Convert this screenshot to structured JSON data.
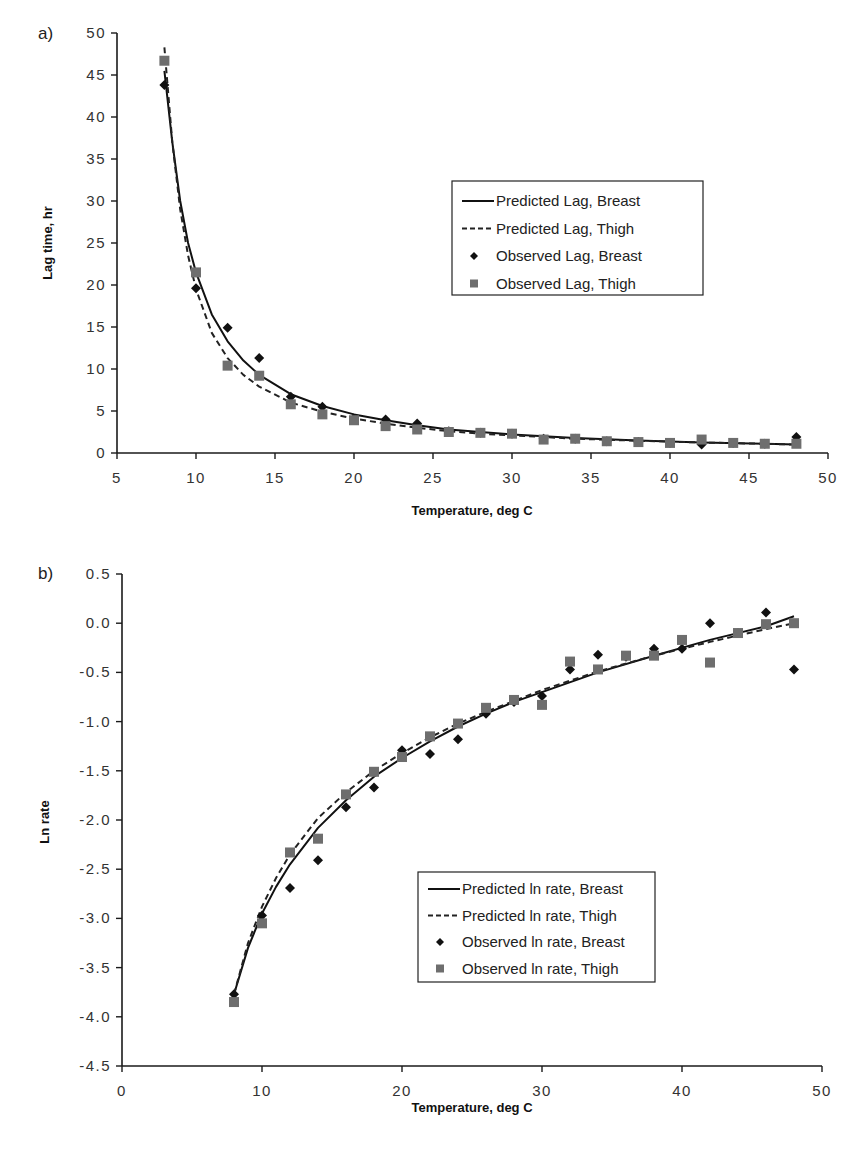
{
  "chart_data": [
    {
      "panel_label": "a)",
      "type": "scatter",
      "title": "",
      "xlabel": "Temperature, deg C",
      "ylabel": "Lag time, hr",
      "xlim": [
        5,
        50
      ],
      "ylim": [
        0,
        50
      ],
      "xticks": [
        5,
        10,
        15,
        20,
        25,
        30,
        35,
        40,
        45,
        50
      ],
      "yticks": [
        0,
        5,
        10,
        15,
        20,
        25,
        30,
        35,
        40,
        45,
        50
      ],
      "ytick_labels": [
        "0",
        "5",
        "10",
        "15",
        "20",
        "25",
        "30",
        "35",
        "40",
        "45",
        "50"
      ],
      "grid": false,
      "legend_position": "upper right (inside)",
      "series": [
        {
          "name": "Predicted Lag, Breast",
          "kind": "line",
          "style": "solid",
          "x": [
            8,
            8.5,
            9,
            9.5,
            10,
            11,
            12,
            13,
            14,
            16,
            18,
            20,
            22,
            24,
            26,
            28,
            30,
            34,
            38,
            42,
            46,
            48
          ],
          "y": [
            45.5,
            37,
            30,
            25,
            21.5,
            16.5,
            13.3,
            11.0,
            9.3,
            7.0,
            5.6,
            4.6,
            3.9,
            3.3,
            2.8,
            2.5,
            2.2,
            1.8,
            1.5,
            1.25,
            1.1,
            1.0
          ]
        },
        {
          "name": "Predicted Lag, Thigh",
          "kind": "line",
          "style": "dashed",
          "x": [
            8,
            8.5,
            9,
            9.5,
            10,
            11,
            12,
            13,
            14,
            16,
            18,
            20,
            22,
            24,
            26,
            28,
            30,
            34,
            38,
            42,
            46,
            48
          ],
          "y": [
            48.3,
            37,
            29,
            23.5,
            19.5,
            14.3,
            11.3,
            9.3,
            7.9,
            6.0,
            4.9,
            4.1,
            3.5,
            3.0,
            2.6,
            2.3,
            2.1,
            1.7,
            1.45,
            1.25,
            1.1,
            1.0
          ]
        },
        {
          "name": "Observed Lag, Breast",
          "kind": "marker",
          "marker": "diamond",
          "x": [
            8,
            10,
            12,
            14,
            16,
            18,
            20,
            22,
            24,
            26,
            28,
            30,
            32,
            34,
            36,
            38,
            40,
            42,
            44,
            46,
            48
          ],
          "y": [
            43.8,
            19.6,
            14.9,
            11.3,
            6.7,
            5.5,
            4.1,
            4.0,
            3.5,
            2.6,
            2.4,
            2.3,
            1.7,
            1.7,
            1.4,
            1.3,
            1.2,
            1.0,
            1.2,
            1.1,
            1.9
          ]
        },
        {
          "name": "Observed Lag, Thigh",
          "kind": "marker",
          "marker": "square",
          "x": [
            8,
            10,
            12,
            14,
            16,
            18,
            20,
            22,
            24,
            26,
            28,
            30,
            32,
            34,
            36,
            38,
            40,
            42,
            44,
            46,
            48
          ],
          "y": [
            46.7,
            21.5,
            10.4,
            9.2,
            5.8,
            4.6,
            3.9,
            3.2,
            2.8,
            2.5,
            2.4,
            2.3,
            1.6,
            1.7,
            1.4,
            1.3,
            1.2,
            1.6,
            1.2,
            1.1,
            1.1
          ]
        }
      ]
    },
    {
      "panel_label": "b)",
      "type": "scatter",
      "title": "",
      "xlabel": "Temperature, deg C",
      "ylabel": "Ln rate",
      "xlim": [
        0,
        50
      ],
      "ylim": [
        -4.5,
        0.5
      ],
      "xticks": [
        0,
        10,
        20,
        30,
        40,
        50
      ],
      "yticks": [
        0.5,
        0.0,
        -0.5,
        -1.0,
        -1.5,
        -2.0,
        -2.5,
        -3.0,
        -3.5,
        -4.0,
        -4.5
      ],
      "ytick_labels": [
        "0.5",
        "0.0",
        "-0.5",
        "-1.0",
        "-1.5",
        "-2.0",
        "-2.5",
        "-3.0",
        "-3.5",
        "-4.0",
        "-4.5"
      ],
      "grid": false,
      "legend_position": "lower right (inside)",
      "series": [
        {
          "name": "Predicted ln rate, Breast",
          "kind": "line",
          "style": "solid",
          "x": [
            8,
            9,
            10,
            11,
            12,
            14,
            16,
            18,
            20,
            22,
            24,
            26,
            28,
            30,
            34,
            38,
            42,
            46,
            48
          ],
          "y": [
            -3.77,
            -3.3,
            -2.95,
            -2.68,
            -2.45,
            -2.08,
            -1.8,
            -1.56,
            -1.37,
            -1.2,
            -1.05,
            -0.92,
            -0.8,
            -0.7,
            -0.5,
            -0.33,
            -0.17,
            -0.03,
            0.07
          ]
        },
        {
          "name": "Predicted ln rate, Thigh",
          "kind": "line",
          "style": "dashed",
          "x": [
            8,
            9,
            10,
            11,
            12,
            14,
            16,
            18,
            20,
            22,
            24,
            26,
            28,
            30,
            34,
            38,
            42,
            46,
            48
          ],
          "y": [
            -3.77,
            -3.25,
            -2.88,
            -2.59,
            -2.35,
            -1.98,
            -1.72,
            -1.5,
            -1.32,
            -1.16,
            -1.02,
            -0.9,
            -0.79,
            -0.68,
            -0.49,
            -0.33,
            -0.19,
            -0.06,
            0.0
          ]
        },
        {
          "name": "Observed ln rate, Breast",
          "kind": "marker",
          "marker": "diamond",
          "x": [
            8,
            10,
            12,
            14,
            16,
            18,
            20,
            22,
            24,
            26,
            28,
            30,
            32,
            34,
            36,
            38,
            40,
            42,
            44,
            46,
            48
          ],
          "y": [
            -3.77,
            -2.97,
            -2.69,
            -2.41,
            -1.87,
            -1.67,
            -1.29,
            -1.33,
            -1.18,
            -0.92,
            -0.8,
            -0.74,
            -0.47,
            -0.32,
            -0.34,
            -0.26,
            -0.26,
            0.0,
            -0.1,
            0.11,
            -0.47
          ]
        },
        {
          "name": "Observed ln rate, Thigh",
          "kind": "marker",
          "marker": "square",
          "x": [
            8,
            10,
            12,
            14,
            16,
            18,
            20,
            22,
            24,
            26,
            28,
            30,
            32,
            34,
            36,
            38,
            40,
            42,
            44,
            46,
            48
          ],
          "y": [
            -3.85,
            -3.05,
            -2.33,
            -2.19,
            -1.74,
            -1.51,
            -1.36,
            -1.15,
            -1.02,
            -0.86,
            -0.78,
            -0.83,
            -0.39,
            -0.47,
            -0.33,
            -0.33,
            -0.17,
            -0.4,
            -0.1,
            -0.01,
            0.0
          ]
        }
      ]
    }
  ],
  "panels": [
    {
      "label": "a)",
      "ylabel": "Lag time, hr",
      "xlabel": "Temperature, deg C",
      "legend": [
        {
          "label": "Predicted Lag, Breast",
          "symbol": "solid-line"
        },
        {
          "label": "Predicted Lag, Thigh",
          "symbol": "dashed-line"
        },
        {
          "label": "Observed Lag, Breast",
          "symbol": "diamond"
        },
        {
          "label": "Observed Lag, Thigh",
          "symbol": "square"
        }
      ]
    },
    {
      "label": "b)",
      "ylabel": "Ln rate",
      "xlabel": "Temperature, deg C",
      "legend": [
        {
          "label": "Predicted ln rate, Breast",
          "symbol": "solid-line"
        },
        {
          "label": "Predicted ln rate, Thigh",
          "symbol": "dashed-line"
        },
        {
          "label": "Observed ln rate, Breast",
          "symbol": "diamond"
        },
        {
          "label": "Observed ln rate, Thigh",
          "symbol": "square"
        }
      ]
    }
  ],
  "colors": {
    "axis": "#1a1a1a",
    "breast_line": "#111111",
    "thigh_line": "#222222",
    "breast_marker": "#111111",
    "thigh_marker": "#6e6e6e",
    "text": "#222222"
  }
}
